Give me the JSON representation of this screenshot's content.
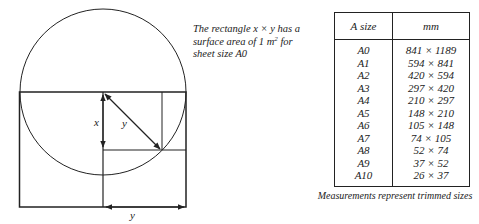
{
  "diagram": {
    "labels": {
      "x_label": "x",
      "y_diag_label": "y",
      "y_bottom_label": "y"
    }
  },
  "caption": {
    "line1": "The rectangle x × y has a",
    "line2_pre": "surface area of 1 m",
    "line2_sup": "2",
    "line2_post": " for",
    "line3": "sheet size A0"
  },
  "table": {
    "headers": [
      "A size",
      "mm"
    ],
    "rows": [
      [
        "A0",
        "841 × 1189"
      ],
      [
        "A1",
        "594 × 841"
      ],
      [
        "A2",
        "420 × 594"
      ],
      [
        "A3",
        "297 × 420"
      ],
      [
        "A4",
        "210 × 297"
      ],
      [
        "A5",
        "148 × 210"
      ],
      [
        "A6",
        "105 × 148"
      ],
      [
        "A7",
        "74 × 105"
      ],
      [
        "A8",
        "52 × 74"
      ],
      [
        "A9",
        "37 × 52"
      ],
      [
        "A10",
        "26 × 37"
      ]
    ]
  },
  "footnote": "Measurements represent trimmed sizes"
}
